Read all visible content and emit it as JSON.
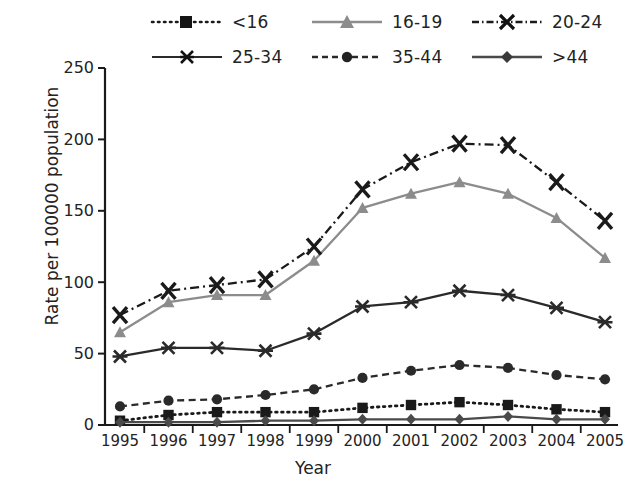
{
  "chart_data": {
    "type": "line",
    "title": "",
    "xlabel": "Year",
    "ylabel": "Rate per 100000 population",
    "categories": [
      "1995",
      "1996",
      "1997",
      "1998",
      "1999",
      "2000",
      "2001",
      "2002",
      "2003",
      "2004",
      "2005"
    ],
    "x": [
      1995,
      1996,
      1997,
      1998,
      1999,
      2000,
      2001,
      2002,
      2003,
      2004,
      2005
    ],
    "xlim": [
      1995,
      2005
    ],
    "ylim": [
      0,
      250
    ],
    "yticks": [
      0,
      50,
      100,
      150,
      200,
      250
    ],
    "grid": false,
    "legend_position": "top",
    "series": [
      {
        "name": "<16",
        "style": "dotted",
        "marker": "square",
        "color": "#1a1a1a",
        "values": [
          3,
          7,
          9,
          9,
          9,
          12,
          14,
          16,
          14,
          11,
          9
        ]
      },
      {
        "name": "16-19",
        "style": "solid",
        "marker": "triangle",
        "color": "#8c8c8c",
        "values": [
          65,
          86,
          91,
          91,
          115,
          152,
          162,
          170,
          162,
          145,
          117
        ]
      },
      {
        "name": "20-24",
        "style": "dash-dot",
        "marker": "x-bold",
        "color": "#1a1a1a",
        "values": [
          77,
          94,
          98,
          102,
          125,
          165,
          184,
          197,
          196,
          170,
          143
        ]
      },
      {
        "name": "25-34",
        "style": "solid",
        "marker": "asterisk",
        "color": "#2a2a2a",
        "values": [
          48,
          54,
          54,
          52,
          64,
          83,
          86,
          94,
          91,
          82,
          72
        ]
      },
      {
        "name": "35-44",
        "style": "dashed",
        "marker": "circle",
        "color": "#2a2a2a",
        "values": [
          13,
          17,
          18,
          21,
          25,
          33,
          38,
          42,
          40,
          35,
          32
        ]
      },
      {
        "name": ">44",
        "style": "solid",
        "marker": "diamond",
        "color": "#4a4a4a",
        "values": [
          2,
          2,
          2,
          3,
          3,
          4,
          4,
          4,
          6,
          4,
          4
        ]
      }
    ]
  },
  "axes": {
    "y_tick_labels": [
      "250",
      "200",
      "150",
      "100",
      "50",
      "0"
    ],
    "x_tick_labels": [
      "1995",
      "1996",
      "1997",
      "1998",
      "1999",
      "2000",
      "2001",
      "2002",
      "2003",
      "2004",
      "2005"
    ],
    "y_axis_title": "Rate per 100000 population",
    "x_axis_title": "Year"
  },
  "legend": {
    "items": [
      {
        "label": "<16"
      },
      {
        "label": "16-19"
      },
      {
        "label": "20-24"
      },
      {
        "label": "25-34"
      },
      {
        "label": "35-44"
      },
      {
        "label": ">44"
      }
    ]
  }
}
